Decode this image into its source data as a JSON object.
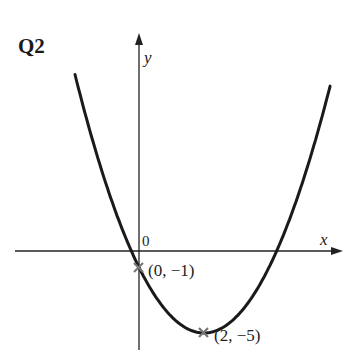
{
  "question_label": "Q2",
  "axes": {
    "x_label": "x",
    "y_label": "y",
    "origin_label": "0"
  },
  "points": [
    {
      "label": "(0, −1)",
      "x": 0,
      "y": -1
    },
    {
      "label": "(2, −5)",
      "x": 2,
      "y": -5
    }
  ],
  "chart_data": {
    "type": "line",
    "title": "Q2",
    "xlabel": "x",
    "ylabel": "y",
    "function": "y = (x - 2)^2 - 5",
    "marked_points": [
      {
        "x": 0,
        "y": -1,
        "label": "(0, −1)"
      },
      {
        "x": 2,
        "y": -5,
        "label": "(2, −5)",
        "role": "vertex"
      }
    ],
    "roots_approx": [
      -0.24,
      4.24
    ],
    "grid": false
  },
  "colors": {
    "curve": "#1a1a1a",
    "axis": "#222222",
    "marker": "#777777"
  }
}
